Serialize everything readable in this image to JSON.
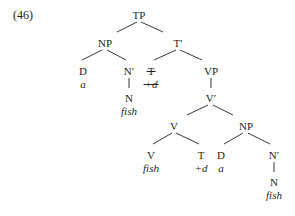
{
  "example_number": "(46)",
  "tree": {
    "root": "TP",
    "subject_np": {
      "label": "NP",
      "d": "D",
      "d_word": "a",
      "nbar": "N′",
      "n": "N",
      "n_word": "fish"
    },
    "tbar": {
      "label": "T′",
      "t_trace": "T",
      "t_trace_word": "+d",
      "t_trace_struck": true
    },
    "vp": {
      "label": "VP",
      "vbar": "V′"
    },
    "complex_v": {
      "label": "V",
      "v": "V",
      "v_word": "fish",
      "t": "T",
      "t_word": "+d"
    },
    "object_np": {
      "label": "NP",
      "d": "D",
      "d_word": "a",
      "nbar": "N′",
      "n": "N",
      "n_word": "fish"
    }
  },
  "colors": {
    "ink": "#231f20",
    "background": "#ffffff"
  }
}
